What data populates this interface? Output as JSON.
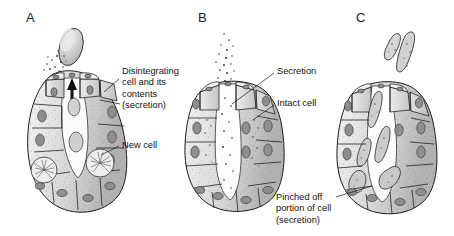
{
  "figure": {
    "background_color": "#ffffff",
    "line_color": "#1a1a1a",
    "panels": [
      {
        "letter": "A",
        "letter_x": 26,
        "letter_y": 10,
        "mode": "holocrine-secretion",
        "callouts": [
          {
            "name": "disintegrating-cell-label",
            "text": "Disintegrating\ncell and its\ncontents\n(secretion)",
            "x": 122,
            "y": 66,
            "leader": {
              "x1": 119,
              "y1": 79,
              "x2": 104,
              "y2": 92
            }
          },
          {
            "name": "new-cell-label",
            "text": "New cell",
            "x": 122,
            "y": 140,
            "leader": {
              "x1": 119,
              "y1": 146,
              "x2": 101,
              "y2": 155
            }
          }
        ]
      },
      {
        "letter": "B",
        "letter_x": 198,
        "letter_y": 10,
        "mode": "merocrine-secretion",
        "callouts": [
          {
            "name": "secretion-label",
            "text": "Secretion",
            "x": 277,
            "y": 66,
            "leader": {
              "x1": 274,
              "y1": 73,
              "x2": 232,
              "y2": 104
            }
          },
          {
            "name": "intact-cell-label",
            "text": "Intact cell",
            "x": 277,
            "y": 98,
            "leader": {
              "x1": 274,
              "y1": 105,
              "x2": 253,
              "y2": 120
            }
          }
        ]
      },
      {
        "letter": "C",
        "letter_x": 356,
        "letter_y": 10,
        "mode": "apocrine-secretion",
        "callouts": [
          {
            "name": "pinched-off-portion-label",
            "text": "Pinched off\nportion of cell\n(secretion)",
            "x": 276,
            "y": 192,
            "leader": {
              "x1": 336,
              "y1": 197,
              "x2": 372,
              "y2": 186
            }
          }
        ]
      }
    ]
  },
  "colors": {
    "cell_light": "#e6e6e6",
    "cell_mid": "#c9c9c9",
    "cell_dark": "#b0b0b0",
    "nucleus": "#9a9a9a",
    "outline": "#1a1a1a",
    "granule": "#2a2a2a",
    "lumen": "#fbfbfb"
  }
}
